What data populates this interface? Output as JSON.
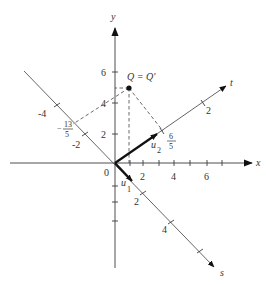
{
  "diagram": {
    "type": "coordinate-rotation",
    "axes": {
      "x": {
        "label": "x",
        "tick_labels": [
          "2",
          "4",
          "6"
        ]
      },
      "y": {
        "label": "y",
        "tick_labels": [
          "2",
          "4",
          "6"
        ]
      },
      "t": {
        "label": "t",
        "tick_labels": [
          "2"
        ],
        "projection_label_num": "6",
        "projection_label_den": "5"
      },
      "s": {
        "label": "s",
        "tick_labels": [
          "-4",
          "-2",
          "2",
          "4"
        ],
        "projection_label_sign": "−",
        "projection_label_num": "13",
        "projection_label_den": "5"
      }
    },
    "origin_label": "0",
    "point": {
      "label": "Q = Q′",
      "x": 1,
      "y": 5
    },
    "vectors": {
      "u1": {
        "base": "u",
        "sub": "1"
      },
      "u2": {
        "base": "u",
        "sub": "2"
      }
    },
    "colors": {
      "line": "#3a3a3a",
      "vector": "#111111",
      "background": "#ffffff"
    }
  }
}
